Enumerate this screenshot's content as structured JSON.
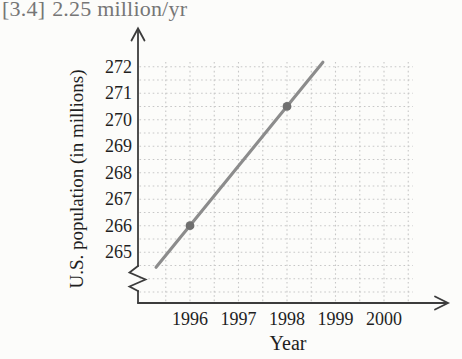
{
  "annotation": {
    "reference": "[3.4]",
    "answer": "2.25 million/yr",
    "full_text": "[3.4] 2.25 million/yr",
    "color": "#767676"
  },
  "chart_data": {
    "type": "line",
    "title": "",
    "xlabel": "Year",
    "ylabel": "U.S. population (in millions)",
    "x_ticks": [
      1996,
      1997,
      1998,
      1999,
      2000
    ],
    "y_ticks": [
      265,
      266,
      267,
      268,
      269,
      270,
      271,
      272
    ],
    "x_minor_step": 0.5,
    "y_minor_step": 0.5,
    "x_grid_range": [
      1995.5,
      2000.5
    ],
    "y_grid_range": [
      263.5,
      272
    ],
    "grid": true,
    "legend": false,
    "y_axis_break_below": 265,
    "points": [
      {
        "x": 1996,
        "y": 266
      },
      {
        "x": 1998,
        "y": 270.5
      }
    ],
    "line_segment": {
      "x1": 1995.3,
      "y1": 264.43,
      "x2": 1998.74,
      "y2": 272.17
    },
    "slope_million_per_yr": 2.25,
    "colors": {
      "line": "#8c8c8c",
      "point": "#6f6f6f",
      "grid": "#c7c7c7",
      "axis": "#3c3c3c",
      "text": "#1f1f1f"
    }
  }
}
